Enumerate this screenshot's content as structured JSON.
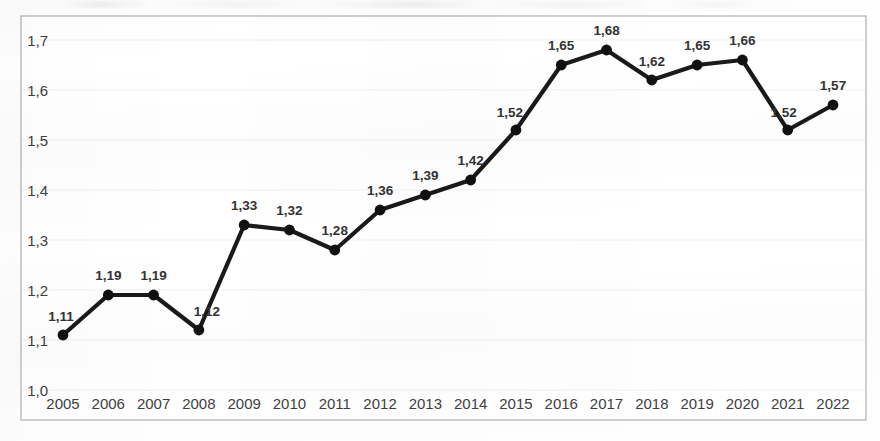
{
  "chart_data": {
    "type": "line",
    "title": "",
    "subtitle": "",
    "xlabel": "",
    "ylabel": "",
    "categories": [
      "2005",
      "2006",
      "2007",
      "2008",
      "2009",
      "2010",
      "2011",
      "2012",
      "2013",
      "2014",
      "2015",
      "2016",
      "2017",
      "2018",
      "2019",
      "2020",
      "2021",
      "2022"
    ],
    "values": [
      1.11,
      1.19,
      1.19,
      1.12,
      1.33,
      1.32,
      1.28,
      1.36,
      1.39,
      1.42,
      1.52,
      1.65,
      1.68,
      1.62,
      1.65,
      1.66,
      1.52,
      1.57
    ],
    "point_labels": [
      "1,11",
      "1,19",
      "1,19",
      "1,12",
      "1,33",
      "1,32",
      "1,28",
      "1,36",
      "1,39",
      "1,42",
      "1,52",
      "1,65",
      "1,68",
      "1,62",
      "1,65",
      "1,66",
      "1,52",
      "1,57"
    ],
    "ylim": [
      1.0,
      1.7
    ],
    "ytick_values": [
      1.0,
      1.1,
      1.2,
      1.3,
      1.4,
      1.5,
      1.6,
      1.7
    ],
    "ytick_labels": [
      "1,0",
      "1,1",
      "1,2",
      "1,3",
      "1,4",
      "1,5",
      "1,6",
      "1,7"
    ],
    "grid": true,
    "grid_axis": "y",
    "legend": false,
    "legend_position": "none",
    "decimal_separator": ",",
    "series": [
      {
        "name": "",
        "color": "#1a1a1a",
        "marker": "circle",
        "values": [
          1.11,
          1.19,
          1.19,
          1.12,
          1.33,
          1.32,
          1.28,
          1.36,
          1.39,
          1.42,
          1.52,
          1.65,
          1.68,
          1.62,
          1.65,
          1.66,
          1.52,
          1.57
        ]
      }
    ]
  },
  "style": {
    "line_color": "#1a1a1a",
    "marker_color": "#111111",
    "grid_color": "#efefef",
    "border_color": "#b0b0b0",
    "tick_label_color": "#3f3f3f",
    "value_label_color": "#333333",
    "plot_background": "#ffffff"
  }
}
